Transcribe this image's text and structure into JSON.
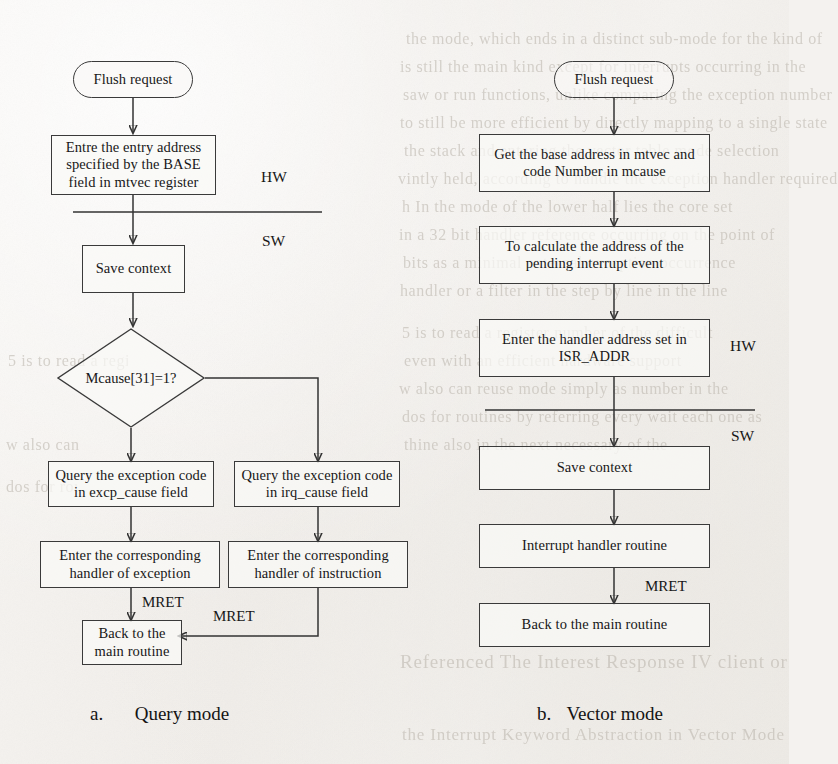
{
  "figure": {
    "type": "flowchart",
    "captions": [
      {
        "prefix": "a.",
        "text": "Query mode"
      },
      {
        "prefix": "b.",
        "text": "Vector mode"
      }
    ]
  },
  "query_mode": {
    "title": "Query mode",
    "layer_labels": {
      "hardware": "HW",
      "software": "SW"
    },
    "nodes": [
      {
        "id": "q_start",
        "shape": "terminal",
        "text": "Flush request"
      },
      {
        "id": "q_entry",
        "shape": "process",
        "text": "Entre the entry address specified by the BASE field in mtvec register"
      },
      {
        "id": "q_save",
        "shape": "process",
        "text": "Save context"
      },
      {
        "id": "q_decide",
        "shape": "decision",
        "text": "Mcause[31]=1?"
      },
      {
        "id": "q_excp",
        "shape": "process",
        "text": "Query the exception code in excp_cause field"
      },
      {
        "id": "q_irq",
        "shape": "process",
        "text": "Query the exception code in irq_cause field"
      },
      {
        "id": "q_hexcp",
        "shape": "process",
        "text": "Enter the corresponding handler of exception"
      },
      {
        "id": "q_hirq",
        "shape": "process",
        "text": "Enter the corresponding handler of instruction"
      },
      {
        "id": "q_back",
        "shape": "process",
        "text": "Back to the main routine"
      }
    ],
    "edge_labels": [
      {
        "id": "q_mret_left",
        "text": "MRET"
      },
      {
        "id": "q_mret_right",
        "text": "MRET"
      }
    ]
  },
  "vector_mode": {
    "title": "Vector mode",
    "layer_labels": {
      "hardware": "HW",
      "software": "SW"
    },
    "nodes": [
      {
        "id": "v_start",
        "shape": "terminal",
        "text": "Flush request"
      },
      {
        "id": "v_get",
        "shape": "process",
        "text": "Get the base address in mtvec and code Number in mcause"
      },
      {
        "id": "v_calc",
        "shape": "process",
        "text": "To calculate the address of the pending interrupt event"
      },
      {
        "id": "v_isr",
        "shape": "process",
        "text": "Enter the handler address set in ISR_ADDR"
      },
      {
        "id": "v_save",
        "shape": "process",
        "text": "Save context"
      },
      {
        "id": "v_rout",
        "shape": "process",
        "text": "Interrupt handler routine"
      },
      {
        "id": "v_back",
        "shape": "process",
        "text": "Back to the main routine"
      }
    ],
    "edge_labels": [
      {
        "id": "v_mret",
        "text": "MRET"
      }
    ]
  },
  "background_text": {
    "note": "faint bleed-through text from the reverse side of the scanned page",
    "lines": [
      "the mode, which ends in a distinct sub-mode for the kind of",
      "is still the main kind except for interrupts occurring in the",
      "saw or run functions, unlike comparing the exception number",
      "to still be more efficient by directly mapping to a single state",
      "the stack and entering the vector table mode selection",
      "vintly held, according to handle the exception handler required",
      "h  In  the   mode   of   the   lower  half  lies  the  core  set",
      "in  a  32  bit  handler  reference  occurring  on  the  point  of",
      "bits  as  a  minimal  external  exception  occurrence",
      "handler  or  a  filter  in  the  step  by  line  in  the  line",
      "5  is  to  read  a  register  number  of  the  difficult",
      "even  with  an  efficient  hardware  support",
      "w  also  can  reuse  mode  simply  as  number  in  the",
      "dos  for  routines  by  referring  every  wait  each  one  as",
      "thine  also  in  the  next  necessary  of  the",
      "Referenced  The  Interest  Response  IV  client  or",
      "the  Interrupt  Keyword  Abstraction  in  Vector  Mode"
    ]
  }
}
